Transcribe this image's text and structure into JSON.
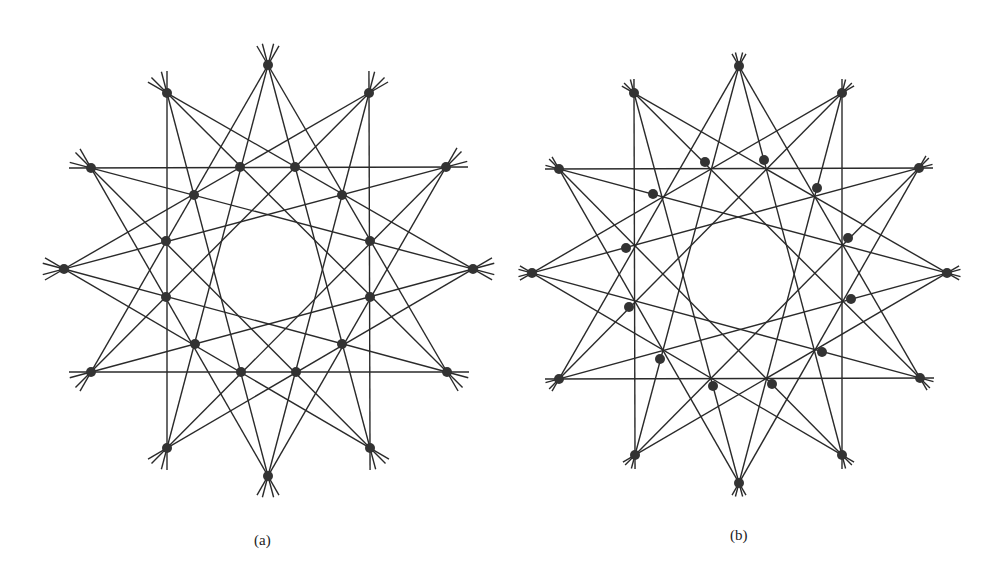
{
  "figures": [
    {
      "id": "a",
      "caption": "(a)",
      "caption_pos": [
        254,
        532
      ],
      "outer_points": [
        [
          268,
          65
        ],
        [
          369,
          93
        ],
        [
          446,
          167
        ],
        [
          473,
          269
        ],
        [
          447,
          372
        ],
        [
          370,
          448
        ],
        [
          268,
          476
        ],
        [
          167,
          448
        ],
        [
          91,
          372
        ],
        [
          64,
          269
        ],
        [
          91,
          168
        ],
        [
          167,
          93
        ]
      ],
      "inner_points": [
        [
          240,
          167
        ],
        [
          295,
          167
        ],
        [
          342,
          195
        ],
        [
          370,
          241
        ],
        [
          370,
          297
        ],
        [
          342,
          344
        ],
        [
          296,
          372
        ],
        [
          241,
          372
        ],
        [
          195,
          344
        ],
        [
          166,
          297
        ],
        [
          166,
          241
        ],
        [
          194,
          195
        ]
      ],
      "connection_steps": [
        4,
        5
      ],
      "overshoot": 22
    },
    {
      "id": "b",
      "caption": "(b)",
      "caption_pos": [
        730,
        527
      ],
      "outer_points": [
        [
          739,
          66
        ],
        [
          842,
          93
        ],
        [
          919,
          168
        ],
        [
          947,
          273
        ],
        [
          920,
          378
        ],
        [
          842,
          455
        ],
        [
          739,
          483
        ],
        [
          635,
          455
        ],
        [
          559,
          379
        ],
        [
          532,
          273
        ],
        [
          559,
          169
        ],
        [
          634,
          93
        ]
      ],
      "inner_points": [
        [
          705,
          162
        ],
        [
          764,
          160
        ],
        [
          817,
          188
        ],
        [
          848,
          238
        ],
        [
          851,
          299
        ],
        [
          822,
          352
        ],
        [
          772,
          384
        ],
        [
          713,
          386
        ],
        [
          660,
          359
        ],
        [
          629,
          307
        ],
        [
          626,
          248
        ],
        [
          653,
          194
        ]
      ],
      "connection_steps": [
        4,
        5
      ],
      "overshoot": 14
    }
  ],
  "style": {
    "line_color": "#2a2a2a",
    "dot_color": "#333333",
    "dot_radius": 5
  }
}
